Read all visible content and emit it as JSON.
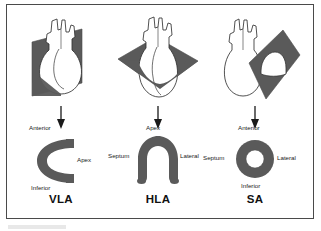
{
  "figure": {
    "kind": "cardiac-imaging-planes-diagram",
    "background_color": "#ffffff",
    "frame_color": "#4a4a4a",
    "plane_fill_color": "#5a5a5a",
    "myocardium_fill_color": "#5a5a5a",
    "heart_fill_color": "#ffffff",
    "outline_color": "#333333",
    "arrow_color": "#1a1a1a",
    "text_color": "#1a1a1a"
  },
  "panels": [
    {
      "id": "vla",
      "title": "VLA",
      "plane_orientation": "vertical",
      "cross_section_shape": "horseshoe-opening-right",
      "labels": {
        "top": "Anterior",
        "right": "Apex",
        "bottom": "Inferior",
        "left": ""
      }
    },
    {
      "id": "hla",
      "title": "HLA",
      "plane_orientation": "horizontal-oblique",
      "cross_section_shape": "horseshoe-opening-down",
      "labels": {
        "top": "Apex",
        "right": "Lateral",
        "bottom": "",
        "left": "Septum"
      }
    },
    {
      "id": "sa",
      "title": "SA",
      "plane_orientation": "short-axis-oblique",
      "cross_section_shape": "annulus-ring",
      "labels": {
        "top": "Anterior",
        "right": "Lateral",
        "bottom": "Inferior",
        "left": "Septum"
      }
    }
  ],
  "arrow": {
    "direction": "down",
    "glyph_name": "down-arrow"
  }
}
